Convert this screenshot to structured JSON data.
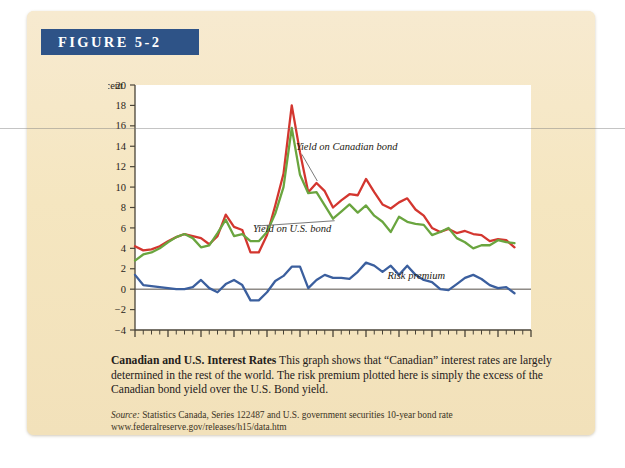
{
  "figure": {
    "banner_label": "FIGURE 5-2"
  },
  "caption": {
    "headline": "Canadian and U.S. Interest Rates",
    "body": "This graph shows that “Canadian” interest rates are largely determined in the rest of the world. The risk premium plotted here is simply the excess of the Canadian bond yield over the U.S. Bond yield."
  },
  "source": {
    "label": "Source:",
    "text": " Statistics Canada, Series 122487 and U.S. government securities 10-year bond rate",
    "url": "www.federalreserve.gov/releases/h15/data.htm"
  },
  "chart_data": {
    "type": "line",
    "title": "",
    "xlabel": "Year",
    "ylabel": "Percent",
    "xlim": [
      1962,
      2010
    ],
    "ylim": [
      -4,
      20
    ],
    "xticks": [
      1962,
      1966,
      1970,
      1974,
      1978,
      1982,
      1986,
      1990,
      1994,
      1998,
      2002,
      2006,
      2010
    ],
    "yticks": [
      -4,
      -2,
      0,
      2,
      4,
      6,
      8,
      10,
      12,
      14,
      16,
      18,
      20
    ],
    "minor_xtick_step": 1,
    "grid": false,
    "legend": "inline-annotations",
    "zero_line": true,
    "x": [
      1962,
      1963,
      1964,
      1965,
      1966,
      1967,
      1968,
      1969,
      1970,
      1971,
      1972,
      1973,
      1974,
      1975,
      1976,
      1977,
      1978,
      1979,
      1980,
      1981,
      1982,
      1983,
      1984,
      1985,
      1986,
      1987,
      1988,
      1989,
      1990,
      1991,
      1992,
      1993,
      1994,
      1995,
      1996,
      1997,
      1998,
      1999,
      2000,
      2001,
      2002,
      2003,
      2004,
      2005,
      2006,
      2007,
      2008
    ],
    "series": [
      {
        "name": "Yield on Canadian bond",
        "color": "#d3362f",
        "values": [
          4.2,
          3.8,
          3.9,
          4.2,
          4.7,
          5.1,
          5.4,
          5.2,
          5.0,
          4.4,
          5.2,
          7.3,
          6.1,
          5.8,
          3.6,
          3.6,
          5.3,
          8.2,
          11.3,
          18.0,
          13.4,
          9.5,
          10.4,
          9.6,
          8.0,
          8.7,
          9.3,
          9.2,
          10.8,
          9.5,
          8.3,
          7.9,
          8.5,
          8.9,
          7.8,
          7.2,
          6.0,
          5.6,
          5.9,
          5.5,
          5.7,
          5.4,
          5.3,
          4.7,
          4.9,
          4.8,
          4.1
        ]
      },
      {
        "name": "Yield on U.S. bond",
        "color": "#6aa53f",
        "values": [
          2.8,
          3.4,
          3.6,
          4.0,
          4.6,
          5.1,
          5.4,
          5.0,
          4.1,
          4.3,
          5.5,
          6.8,
          5.2,
          5.4,
          4.7,
          4.7,
          5.6,
          7.4,
          10.0,
          15.8,
          11.2,
          9.4,
          9.5,
          8.2,
          6.9,
          7.6,
          8.3,
          7.5,
          8.2,
          7.2,
          6.6,
          5.6,
          7.1,
          6.6,
          6.4,
          6.3,
          5.3,
          5.6,
          6.0,
          5.0,
          4.6,
          4.0,
          4.3,
          4.3,
          4.8,
          4.6,
          4.5
        ]
      },
      {
        "name": "Risk premium",
        "color": "#3b5f9e",
        "values": [
          1.4,
          0.4,
          0.3,
          0.2,
          0.1,
          0.0,
          0.0,
          0.2,
          0.9,
          0.1,
          -0.3,
          0.5,
          0.9,
          0.4,
          -1.1,
          -1.1,
          -0.3,
          0.8,
          1.3,
          2.2,
          2.2,
          0.1,
          0.9,
          1.4,
          1.1,
          1.1,
          1.0,
          1.7,
          2.6,
          2.3,
          1.7,
          2.3,
          1.4,
          2.3,
          1.4,
          0.9,
          0.7,
          0.0,
          -0.1,
          0.5,
          1.1,
          1.4,
          1.0,
          0.4,
          0.1,
          0.2,
          -0.4
        ]
      }
    ],
    "annotations": [
      {
        "text": "Yield on Canadian bond",
        "series": "Yield on Canadian bond"
      },
      {
        "text": "Yield on U.S. bond",
        "series": "Yield on U.S. bond"
      },
      {
        "text": "Risk premium",
        "series": "Risk premium"
      }
    ]
  }
}
